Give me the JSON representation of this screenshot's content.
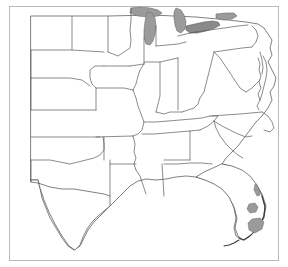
{
  "figure": {
    "type": "reference-map",
    "background_color": "#ffffff",
    "frame_color": "#b9b9b9",
    "boundary_color": "#4a4a4a",
    "water_fill_color": "#9b9b9b",
    "shaded_region_color": "#9a9a9a",
    "width": 288,
    "height": 267,
    "labels_visible": "none"
  },
  "map": {
    "projection_extent": "central and eastern United States; western edge cuts through the Rocky Mountain states",
    "features": {
      "state_boundaries": "thin gray outlines, unlabeled",
      "national_border_north": "United States - Canada border along the top edge",
      "coastlines": "Atlantic coast on the right, Gulf of Mexico along the bottom"
    },
    "water_bodies": [
      {
        "name": "Lake Michigan",
        "fill": "#9b9b9b"
      },
      {
        "name": "Lake Huron",
        "fill": "#9b9b9b"
      },
      {
        "name": "Lake Erie",
        "fill": "#9b9b9b"
      },
      {
        "name": "Lake Ontario",
        "fill": "#9b9b9b"
      },
      {
        "name": "Lake Superior (partial)",
        "fill": "#9b9b9b"
      },
      {
        "name": "Lake Okeechobee",
        "fill": "#9a9a9a"
      },
      {
        "name": "Chesapeake Bay",
        "fill": "#ffffff"
      }
    ],
    "shaded_regions": [
      {
        "name": "South Florida coastal area",
        "fill": "#9a9a9a"
      },
      {
        "name": "Florida east coast strip",
        "fill": "#9a9a9a"
      }
    ],
    "regions_depicted": [
      "Great Plains",
      "Midwest",
      "Great Lakes",
      "Northeast",
      "Mid-Atlantic",
      "Southeast",
      "Gulf Coast",
      "Florida Peninsula",
      "Texas"
    ]
  }
}
